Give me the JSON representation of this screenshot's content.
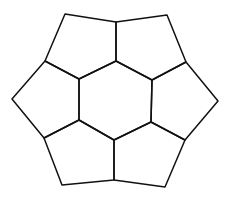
{
  "diagram": {
    "type": "tiling",
    "stroke_color": "#111111",
    "background": "#ffffff",
    "vertices": {
      "TL": [
        65,
        14
      ],
      "TM": [
        116,
        22
      ],
      "TR": [
        167,
        15
      ],
      "UL": [
        45,
        61
      ],
      "UR": [
        186,
        62
      ],
      "HT": [
        116,
        61
      ],
      "HUL": [
        79,
        79
      ],
      "HUR": [
        152,
        80
      ],
      "HLL": [
        79,
        120
      ],
      "HLR": [
        151,
        122
      ],
      "HB": [
        114,
        140
      ],
      "L": [
        12,
        99
      ],
      "R": [
        218,
        101
      ],
      "LL": [
        44,
        138
      ],
      "LR": [
        185,
        140
      ],
      "BL": [
        62,
        185
      ],
      "BM": [
        114,
        180
      ],
      "BR": [
        165,
        187
      ]
    },
    "faces": [
      {
        "name": "center-hexagon",
        "points": "116,61 152,80 151,122 114,140 79,120 79,79"
      },
      {
        "name": "pentagon-top-left",
        "points": "65,14 116,22 116,61 79,79 45,61"
      },
      {
        "name": "pentagon-top-right",
        "points": "116,22 167,15 186,62 152,80 116,61"
      },
      {
        "name": "pentagon-right",
        "points": "186,62 218,101 185,140 151,122 152,80"
      },
      {
        "name": "pentagon-bottom-right",
        "points": "151,122 185,140 165,187 114,180 114,140"
      },
      {
        "name": "pentagon-bottom-left",
        "points": "79,120 114,140 114,180 62,185 44,138"
      },
      {
        "name": "pentagon-left",
        "points": "45,61 79,79 79,120 44,138 12,99"
      }
    ]
  }
}
